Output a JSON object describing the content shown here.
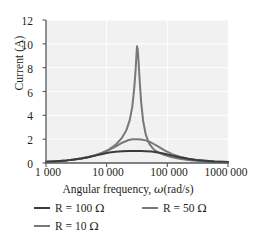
{
  "chart_data": {
    "type": "line",
    "title": "",
    "subtitle": "",
    "xlabel_parts": {
      "prefix": "Angular frequency, ",
      "symbol": "ω",
      "suffix": "(rad/s)"
    },
    "xlabel": "Angular frequency, ω(rad/s)",
    "ylabel": "Current (A)",
    "xscale": "log",
    "xlim": [
      1000,
      1000000
    ],
    "ylim": [
      0,
      12
    ],
    "grid": true,
    "grid_color": "#ffffff",
    "plot_background": "#f1f1f1",
    "legend_position": "below-axis",
    "x_tick_values": [
      1000,
      10000,
      100000,
      1000000
    ],
    "x_tick_labels": [
      "1 000",
      "10 000",
      "100 000",
      "1000 000"
    ],
    "y_tick_values": [
      0,
      2,
      4,
      6,
      8,
      10,
      12
    ],
    "y_tick_labels": [
      "0",
      "2",
      "4",
      "6",
      "8",
      "10",
      "12"
    ],
    "resonance_omega": 31623,
    "source_emf_volts": 100,
    "inductance_H": 0.316,
    "series": [
      {
        "name": "R = 100 Ω",
        "label_prefix": "R = ",
        "label_value": "100",
        "label_unit": "Ω",
        "resistance_ohms": 100,
        "color": "#3b3b3b",
        "width": 2.0,
        "peak_value": 1.0,
        "x": [
          1000,
          1300,
          1700,
          2200,
          2900,
          3800,
          5000,
          6500,
          8500,
          11000,
          14000,
          18000,
          23000,
          27000,
          31623,
          37000,
          44000,
          55000,
          70000,
          90000,
          120000,
          160000,
          220000,
          300000,
          420000,
          600000,
          1000000
        ],
        "y": [
          0.1,
          0.13,
          0.17,
          0.22,
          0.29,
          0.38,
          0.49,
          0.62,
          0.76,
          0.88,
          0.95,
          0.99,
          1.0,
          1.0,
          1.0,
          1.0,
          0.99,
          0.96,
          0.89,
          0.78,
          0.62,
          0.48,
          0.35,
          0.26,
          0.19,
          0.13,
          0.08
        ]
      },
      {
        "name": "R = 50 Ω",
        "label_prefix": "R = ",
        "label_value": "50",
        "label_unit": "Ω",
        "resistance_ohms": 50,
        "color": "#77787b",
        "width": 2.0,
        "peak_value": 2.0,
        "x": [
          1000,
          1300,
          1700,
          2200,
          2900,
          3800,
          5000,
          6500,
          8500,
          11000,
          14000,
          18000,
          23000,
          27000,
          31623,
          37000,
          44000,
          55000,
          70000,
          90000,
          120000,
          160000,
          220000,
          300000,
          420000,
          600000,
          1000000
        ],
        "y": [
          0.1,
          0.13,
          0.17,
          0.22,
          0.29,
          0.38,
          0.5,
          0.65,
          0.85,
          1.1,
          1.38,
          1.7,
          1.93,
          1.99,
          2.0,
          1.98,
          1.9,
          1.7,
          1.39,
          1.06,
          0.74,
          0.52,
          0.36,
          0.26,
          0.19,
          0.13,
          0.08
        ]
      },
      {
        "name": "R = 10 Ω",
        "label_prefix": "R = ",
        "label_value": "10",
        "label_unit": "Ω",
        "resistance_ohms": 10,
        "color": "#77787b",
        "width": 2.0,
        "peak_value": 9.8,
        "x": [
          1000,
          1300,
          1700,
          2200,
          2900,
          3800,
          5000,
          6500,
          8500,
          11000,
          14000,
          18000,
          21000,
          24000,
          26500,
          28500,
          30000,
          31000,
          31623,
          32500,
          33500,
          35000,
          37000,
          40000,
          44000,
          50000,
          58000,
          70000,
          90000,
          120000,
          160000,
          220000,
          300000,
          420000,
          600000,
          1000000
        ],
        "y": [
          0.1,
          0.13,
          0.17,
          0.22,
          0.29,
          0.38,
          0.5,
          0.66,
          0.87,
          1.15,
          1.52,
          2.13,
          2.72,
          3.6,
          4.75,
          6.3,
          7.8,
          9.1,
          9.8,
          9.55,
          8.6,
          6.9,
          5.1,
          3.5,
          2.4,
          1.65,
          1.2,
          0.9,
          0.66,
          0.48,
          0.35,
          0.25,
          0.18,
          0.13,
          0.09,
          0.05
        ]
      }
    ]
  }
}
